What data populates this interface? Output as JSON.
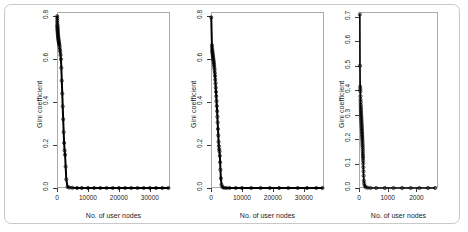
{
  "figure": {
    "panel_count": 3,
    "frame_color": "#c9c9c9",
    "axis_color": "#aaaaaa",
    "series_color": "#000000"
  },
  "chart_data": [
    {
      "type": "scatter",
      "title": "",
      "xlabel": "No. of user nodes",
      "ylabel": "Gini coefficient",
      "xlim": [
        0,
        36500
      ],
      "ylim": [
        0.0,
        0.82
      ],
      "xticks": [
        0,
        10000,
        20000,
        30000
      ],
      "xticklabels": [
        "0",
        "10000",
        "20000",
        "30000"
      ],
      "yticks": [
        0.0,
        0.2,
        0.4,
        0.6,
        0.8
      ],
      "yticklabels": [
        "0.0",
        "0.2",
        "0.4",
        "0.6",
        "0.8"
      ],
      "grid": false,
      "legend": "none",
      "x": [
        60,
        70,
        80,
        95,
        110,
        125,
        140,
        160,
        180,
        200,
        220,
        245,
        270,
        300,
        330,
        360,
        400,
        440,
        480,
        530,
        580,
        640,
        700,
        770,
        850,
        940,
        1040,
        1150,
        1270,
        1400,
        1550,
        1700,
        1850,
        2000,
        2150,
        2300,
        2450,
        2600,
        2800,
        3000,
        3400,
        4000,
        5000,
        6500,
        8000,
        10000,
        12000,
        14000,
        16000,
        18000,
        20000,
        22000,
        24000,
        26000,
        28000,
        30000,
        32000,
        34000,
        36000
      ],
      "y": [
        0.8,
        0.79,
        0.78,
        0.77,
        0.76,
        0.755,
        0.75,
        0.745,
        0.74,
        0.735,
        0.73,
        0.725,
        0.72,
        0.715,
        0.71,
        0.705,
        0.7,
        0.695,
        0.69,
        0.685,
        0.68,
        0.675,
        0.67,
        0.665,
        0.655,
        0.645,
        0.635,
        0.62,
        0.6,
        0.56,
        0.5,
        0.44,
        0.38,
        0.32,
        0.26,
        0.21,
        0.175,
        0.155,
        0.1,
        0.04,
        0.005,
        0.002,
        0.001,
        0.0,
        0.0,
        0.0,
        0.0,
        0.0,
        0.0,
        0.0,
        0.0,
        0.0,
        0.0,
        0.0,
        0.0,
        0.0,
        0.0,
        0.0,
        0.0
      ]
    },
    {
      "type": "scatter",
      "title": "",
      "xlabel": "No. of user nodes",
      "ylabel": "Gini coefficient",
      "xlim": [
        0,
        36500
      ],
      "ylim": [
        0.0,
        0.82
      ],
      "xticks": [
        0,
        10000,
        20000,
        30000
      ],
      "xticklabels": [
        "0",
        "10000",
        "20000",
        "30000"
      ],
      "yticks": [
        0.0,
        0.2,
        0.4,
        0.6,
        0.8
      ],
      "yticklabels": [
        "0.0",
        "0.2",
        "0.4",
        "0.6",
        "0.8"
      ],
      "grid": false,
      "legend": "none",
      "x": [
        80,
        300,
        340,
        380,
        420,
        470,
        520,
        570,
        620,
        670,
        720,
        780,
        840,
        900,
        960,
        1020,
        1090,
        1160,
        1230,
        1300,
        1380,
        1460,
        1540,
        1620,
        1700,
        1790,
        1880,
        1970,
        2060,
        2150,
        2250,
        2350,
        2450,
        2550,
        2650,
        2750,
        2850,
        2950,
        3050,
        3200,
        3400,
        3700,
        4200,
        5000,
        6000,
        8000,
        10000,
        13000,
        16000,
        19000,
        22000,
        25000,
        28000,
        31000,
        34000,
        36000
      ],
      "y": [
        0.795,
        0.665,
        0.655,
        0.645,
        0.638,
        0.632,
        0.626,
        0.62,
        0.614,
        0.608,
        0.602,
        0.596,
        0.59,
        0.583,
        0.576,
        0.568,
        0.558,
        0.548,
        0.536,
        0.522,
        0.505,
        0.487,
        0.468,
        0.448,
        0.428,
        0.405,
        0.382,
        0.358,
        0.332,
        0.305,
        0.275,
        0.245,
        0.215,
        0.195,
        0.18,
        0.17,
        0.15,
        0.12,
        0.085,
        0.045,
        0.015,
        0.004,
        0.001,
        0.0,
        0.0,
        0.0,
        0.0,
        0.0,
        0.0,
        0.0,
        0.0,
        0.0,
        0.0,
        0.0,
        0.0,
        0.0
      ]
    },
    {
      "type": "scatter",
      "title": "",
      "xlabel": "No. of user nodes",
      "ylabel": "Gini coefficient",
      "xlim": [
        0,
        2750
      ],
      "ylim": [
        0.0,
        0.72
      ],
      "xticks": [
        0,
        1000,
        2000
      ],
      "xticklabels": [
        "0",
        "1000",
        "2000"
      ],
      "yticks": [
        0.0,
        0.1,
        0.2,
        0.3,
        0.4,
        0.5,
        0.6,
        0.7
      ],
      "yticklabels": [
        "0.0",
        "0.1",
        "0.2",
        "0.3",
        "0.4",
        "0.5",
        "0.6",
        "0.7"
      ],
      "grid": false,
      "legend": "none",
      "x": [
        30,
        35,
        40,
        45,
        48,
        52,
        55,
        58,
        60,
        63,
        66,
        68,
        70,
        73,
        75,
        78,
        80,
        83,
        85,
        88,
        90,
        93,
        95,
        98,
        100,
        103,
        105,
        108,
        110,
        113,
        115,
        118,
        120,
        123,
        125,
        128,
        130,
        133,
        135,
        138,
        140,
        143,
        146,
        150,
        155,
        160,
        170,
        180,
        200,
        240,
        300,
        400,
        600,
        900,
        1200,
        1500,
        1800,
        2100,
        2400,
        2650
      ],
      "y": [
        0.71,
        0.5,
        0.415,
        0.405,
        0.395,
        0.375,
        0.36,
        0.35,
        0.34,
        0.332,
        0.325,
        0.318,
        0.31,
        0.303,
        0.296,
        0.29,
        0.284,
        0.278,
        0.272,
        0.266,
        0.26,
        0.254,
        0.248,
        0.242,
        0.236,
        0.23,
        0.224,
        0.218,
        0.212,
        0.206,
        0.2,
        0.193,
        0.186,
        0.179,
        0.172,
        0.165,
        0.157,
        0.149,
        0.14,
        0.131,
        0.122,
        0.112,
        0.1,
        0.085,
        0.068,
        0.05,
        0.03,
        0.018,
        0.008,
        0.003,
        0.001,
        0.0,
        0.0,
        0.0,
        0.0,
        0.0,
        0.0,
        0.0,
        0.0,
        0.0
      ]
    }
  ],
  "panels": [
    {
      "id": "panel-1",
      "ylabel": "Gini coefficient",
      "xlabel": "No. of user nodes",
      "xticklabels": [
        "0",
        "10000",
        "20000",
        "30000"
      ],
      "yticklabels": [
        "0.0",
        "0.2",
        "0.4",
        "0.6",
        "0.8"
      ]
    },
    {
      "id": "panel-2",
      "ylabel": "Gini coefficient",
      "xlabel": "No. of user nodes",
      "xticklabels": [
        "0",
        "10000",
        "20000",
        "30000"
      ],
      "yticklabels": [
        "0.0",
        "0.2",
        "0.4",
        "0.6",
        "0.8"
      ]
    },
    {
      "id": "panel-3",
      "ylabel": "Gini coefficient",
      "xlabel": "No. of user nodes",
      "xticklabels": [
        "0",
        "1000",
        "2000"
      ],
      "yticklabels": [
        "0.0",
        "0.1",
        "0.2",
        "0.3",
        "0.4",
        "0.5",
        "0.6",
        "0.7"
      ]
    }
  ]
}
